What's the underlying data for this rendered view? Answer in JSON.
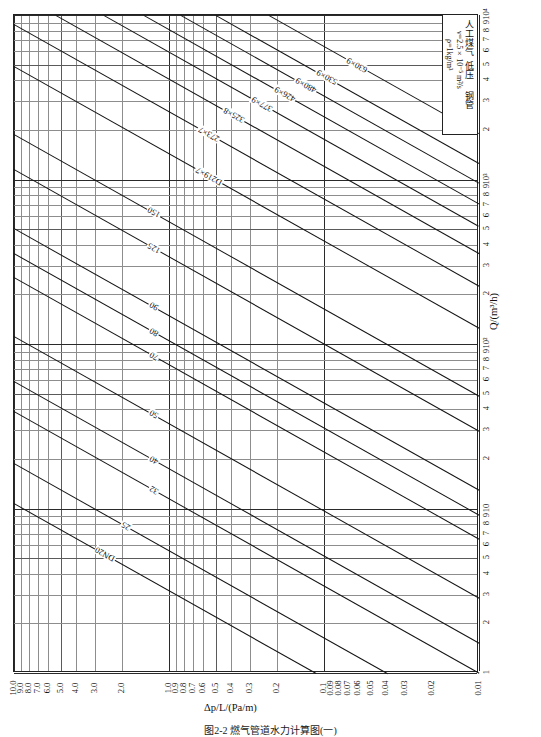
{
  "figure": {
    "caption": "图2-2  燃气管道水力计算图(一)",
    "rotated": true
  },
  "legend": {
    "line1": "人工煤气",
    "line2": "低压",
    "line3": "钢管",
    "line4": "ν=2.5×10⁻⁵ m²/s",
    "line5": "ρ=1kg/m³"
  },
  "axes": {
    "pressure": {
      "title": "Δp/L/(Pa/m)",
      "labels": [
        "10.0",
        "9.0",
        "8.0",
        "7.0",
        "6.0",
        "5.0",
        "4.0",
        "3.0",
        "2.0",
        "1.0",
        "0.9",
        "0.8",
        "0.7",
        "0.6",
        "0.5",
        "0.4",
        "0.3",
        "0.2",
        "0.1",
        "0.09",
        "0.08",
        "0.07",
        "0.06",
        "0.05",
        "0.04",
        "0.03",
        "0.02",
        "0.01"
      ],
      "min": 0.01,
      "max": 10.0
    },
    "flow": {
      "title": "Q/(m³/h)",
      "labels": [
        "1",
        "2",
        "3",
        "4",
        "5",
        "6",
        "7",
        "8",
        "9",
        "10",
        "2",
        "3",
        "4",
        "5",
        "6",
        "7",
        "8",
        "9",
        "10²",
        "2",
        "3",
        "4",
        "5",
        "6",
        "7",
        "8",
        "9",
        "10³",
        "2",
        "3",
        "4",
        "5",
        "6",
        "7",
        "8",
        "9",
        "10⁴"
      ],
      "min": 1,
      "max": 10000
    }
  },
  "pipe_labels": [
    "DN20",
    "25",
    "32",
    "40",
    "50",
    "70",
    "80",
    "90",
    "125",
    "150",
    "D219×7",
    "273×7",
    "325×8",
    "377×9",
    "426×9",
    "480×9",
    "530×9",
    "630×9"
  ],
  "chart_data": {
    "type": "line",
    "subtitle": "ν=2.5×10⁻⁵ m²/s, ρ=1kg/m³",
    "xlabel": "Q/(m³/h)",
    "ylabel": "Δp/L/(Pa/m)",
    "xlim": [
      1,
      10000
    ],
    "ylim": [
      0.01,
      10.0
    ],
    "xscale": "log",
    "yscale": "log",
    "grid": true,
    "legend_position": "top-right-box",
    "orientation": "rotated-90",
    "x_ticks": [
      1,
      2,
      3,
      4,
      5,
      6,
      7,
      8,
      9,
      10,
      20,
      30,
      40,
      50,
      60,
      70,
      80,
      90,
      100,
      200,
      300,
      400,
      500,
      600,
      700,
      800,
      900,
      1000,
      2000,
      3000,
      4000,
      5000,
      6000,
      7000,
      8000,
      9000,
      10000
    ],
    "y_ticks": [
      0.01,
      0.02,
      0.03,
      0.04,
      0.05,
      0.06,
      0.07,
      0.08,
      0.09,
      0.1,
      0.2,
      0.3,
      0.4,
      0.5,
      0.6,
      0.7,
      0.8,
      0.9,
      1.0,
      2.0,
      3.0,
      4.0,
      5.0,
      6.0,
      7.0,
      8.0,
      9.0,
      10.0
    ],
    "series": [
      {
        "name": "DN20",
        "intercept_q_at_dpl_1": 3.2
      },
      {
        "name": "25",
        "intercept_q_at_dpl_1": 5.6
      },
      {
        "name": "32",
        "intercept_q_at_dpl_1": 11.5
      },
      {
        "name": "40",
        "intercept_q_at_dpl_1": 17.5
      },
      {
        "name": "50",
        "intercept_q_at_dpl_1": 33
      },
      {
        "name": "70",
        "intercept_q_at_dpl_1": 75
      },
      {
        "name": "80",
        "intercept_q_at_dpl_1": 105
      },
      {
        "name": "90",
        "intercept_q_at_dpl_1": 150
      },
      {
        "name": "125",
        "intercept_q_at_dpl_1": 340
      },
      {
        "name": "150",
        "intercept_q_at_dpl_1": 560
      },
      {
        "name": "D219×7",
        "intercept_q_at_dpl_1": 1450
      },
      {
        "name": "273×7",
        "intercept_q_at_dpl_1": 2600
      },
      {
        "name": "325×8",
        "intercept_q_at_dpl_1": 4100
      },
      {
        "name": "377×9",
        "intercept_q_at_dpl_1": 6000
      },
      {
        "name": "426×9",
        "intercept_q_at_dpl_1": 8200
      },
      {
        "name": "480×9",
        "intercept_q_at_dpl_1": 11000
      },
      {
        "name": "530×9",
        "intercept_q_at_dpl_1": 14500
      },
      {
        "name": "630×9",
        "intercept_q_at_dpl_1": 22000
      }
    ],
    "note": "Each diagonal line is a nominal pipe size; slope ≈ 1/1.9 on the log-log field (Q ∝ Δp/L^0.53)."
  }
}
